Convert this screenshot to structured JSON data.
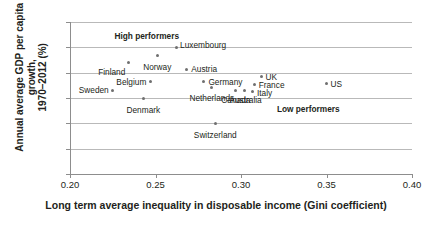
{
  "chart_data": {
    "type": "scatter",
    "title": "",
    "xlabel": "Long term average inequality in disposable income (Gini coefficient)",
    "ylabel_line1": "Annual average GDP per capita growth,",
    "ylabel_line2": "1970–2012 (%)",
    "xlim": [
      0.2,
      0.4
    ],
    "ylim": [
      0,
      3.0
    ],
    "xticks": [
      "0.20",
      "0.25",
      "0.30",
      "0.35",
      "0.40"
    ],
    "xtick_values": [
      0.2,
      0.25,
      0.3,
      0.35,
      0.4
    ],
    "yticks": [
      "0",
      "0.5",
      "1.0",
      "1.5",
      "2.0",
      "2.5",
      "3.0"
    ],
    "ytick_values": [
      0,
      0.5,
      1.0,
      1.5,
      2.0,
      2.5,
      3.0
    ],
    "grid": "horizontal",
    "legend": "none",
    "marker_color": "#6f6f6f",
    "grid_color": "#b9b9b9",
    "axis_color": "#8d8d8d",
    "text_color": "#231f20",
    "points": [
      {
        "name": "Sweden",
        "x": 0.225,
        "y": 1.65,
        "label_dx": -4,
        "label_dy": 0,
        "label_anchor": "right"
      },
      {
        "name": "Finland",
        "x": 0.234,
        "y": 2.2,
        "label_dx": -3,
        "label_dy": 9,
        "label_anchor": "right"
      },
      {
        "name": "Denmark",
        "x": 0.243,
        "y": 1.5,
        "label_dx": 0,
        "label_dy": 12,
        "label_anchor": "center"
      },
      {
        "name": "Belgium",
        "x": 0.247,
        "y": 1.82,
        "label_dx": -4,
        "label_dy": 0,
        "label_anchor": "right"
      },
      {
        "name": "Norway",
        "x": 0.251,
        "y": 2.33,
        "label_dx": 0,
        "label_dy": 11,
        "label_anchor": "center"
      },
      {
        "name": "Luxembourg",
        "x": 0.262,
        "y": 2.5,
        "label_dx": 4,
        "label_dy": -2,
        "label_anchor": "left"
      },
      {
        "name": "Austria",
        "x": 0.268,
        "y": 2.07,
        "label_dx": 5,
        "label_dy": 0,
        "label_anchor": "left"
      },
      {
        "name": "Germany",
        "x": 0.278,
        "y": 1.83,
        "label_dx": 5,
        "label_dy": 1,
        "label_anchor": "left"
      },
      {
        "name": "Netherlands",
        "x": 0.283,
        "y": 1.7,
        "label_dx": 0,
        "label_dy": 10,
        "label_anchor": "center"
      },
      {
        "name": "Switzerland",
        "x": 0.285,
        "y": 1.0,
        "label_dx": 0,
        "label_dy": 12,
        "label_anchor": "center"
      },
      {
        "name": "Canada",
        "x": 0.297,
        "y": 1.65,
        "label_dx": 0,
        "label_dy": 10,
        "label_anchor": "center"
      },
      {
        "name": "Australia",
        "x": 0.302,
        "y": 1.65,
        "label_dx": 1,
        "label_dy": 10,
        "label_anchor": "center"
      },
      {
        "name": "Italy",
        "x": 0.307,
        "y": 1.62,
        "label_dx": 4,
        "label_dy": 1,
        "label_anchor": "left"
      },
      {
        "name": "France",
        "x": 0.308,
        "y": 1.77,
        "label_dx": 4,
        "label_dy": 1,
        "label_anchor": "left"
      },
      {
        "name": "UK",
        "x": 0.312,
        "y": 1.93,
        "label_dx": 4,
        "label_dy": 1,
        "label_anchor": "left"
      },
      {
        "name": "US",
        "x": 0.35,
        "y": 1.79,
        "label_dx": 4,
        "label_dy": 1,
        "label_anchor": "left"
      }
    ],
    "annotations": [
      {
        "text": "High performers",
        "x": 0.226,
        "y": 2.72
      },
      {
        "text": "Low performers",
        "x": 0.321,
        "y": 1.28
      }
    ]
  }
}
